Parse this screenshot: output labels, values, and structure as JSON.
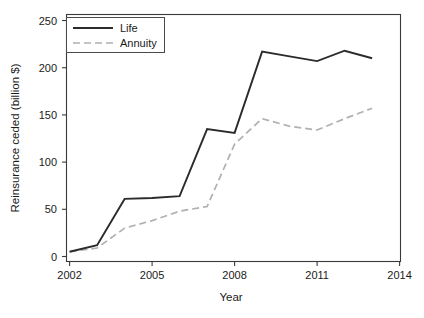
{
  "chart_data": {
    "type": "line",
    "title": "",
    "xlabel": "Year",
    "ylabel": "Reinsurance ceded (billion $)",
    "xlim": [
      2002,
      2014
    ],
    "ylim": [
      0,
      250
    ],
    "grid": false,
    "legend_position": "top-left",
    "xticks": [
      2002,
      2005,
      2008,
      2011,
      2014
    ],
    "xtick_labels": [
      "2002",
      "2005",
      "2008",
      "2011",
      "2014"
    ],
    "yticks": [
      0,
      50,
      100,
      150,
      200,
      250
    ],
    "ytick_labels": [
      "0",
      "50",
      "100",
      "150",
      "200",
      "250"
    ],
    "x": [
      2002,
      2003,
      2004,
      2005,
      2006,
      2007,
      2008,
      2009,
      2010,
      2011,
      2012,
      2013
    ],
    "series": [
      {
        "name": "Life",
        "color": "#2b2b2b",
        "style": "solid",
        "values": [
          5,
          12,
          61,
          62,
          64,
          135,
          131,
          217,
          212,
          207,
          218,
          210
        ]
      },
      {
        "name": "Annuity",
        "color": "#b0b0b0",
        "style": "dashed",
        "values": [
          5,
          9,
          30,
          38,
          48,
          53,
          119,
          146,
          138,
          134,
          146,
          157
        ]
      }
    ]
  },
  "legend": {
    "entries": [
      {
        "label": "Life"
      },
      {
        "label": "Annuity"
      }
    ]
  },
  "axes": {
    "x_title": "Year",
    "y_title": "Reinsurance ceded (billion $)"
  }
}
